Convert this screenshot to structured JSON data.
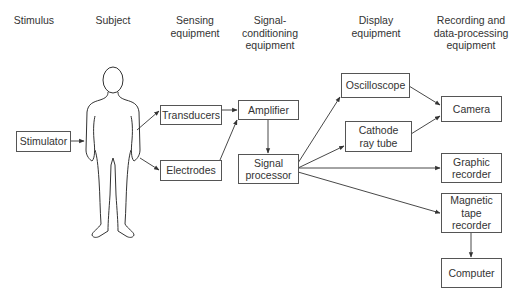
{
  "headers": {
    "stimulus": "Stimulus",
    "subject": "Subject",
    "sensing": "Sensing\nequipment",
    "conditioning": "Signal-\nconditioning\nequipment",
    "display": "Display\nequipment",
    "recording": "Recording and\ndata-processing\nequipment"
  },
  "nodes": {
    "stimulator": "Stimulator",
    "transducers": "Transducers",
    "electrodes": "Electrodes",
    "amplifier": "Amplifier",
    "signal_processor": "Signal\nprocessor",
    "oscilloscope": "Oscilloscope",
    "crt": "Cathode\nray tube",
    "camera": "Camera",
    "graphic_recorder": "Graphic\nrecorder",
    "tape_recorder": "Magnetic\ntape\nrecorder",
    "computer": "Computer"
  },
  "subject_figure": "human-body-outline",
  "edges": [
    [
      "Stimulator",
      "Subject"
    ],
    [
      "Subject",
      "Transducers"
    ],
    [
      "Subject",
      "Electrodes"
    ],
    [
      "Transducers",
      "Amplifier"
    ],
    [
      "Electrodes",
      "Amplifier"
    ],
    [
      "Amplifier",
      "Signal processor"
    ],
    [
      "Signal processor",
      "Oscilloscope"
    ],
    [
      "Signal processor",
      "Cathode ray tube"
    ],
    [
      "Signal processor",
      "Graphic recorder"
    ],
    [
      "Signal processor",
      "Magnetic tape recorder"
    ],
    [
      "Oscilloscope",
      "Camera"
    ],
    [
      "Cathode ray tube",
      "Camera"
    ],
    [
      "Magnetic tape recorder",
      "Computer"
    ]
  ],
  "colors": {
    "line": "#333333",
    "box_border": "#555555",
    "text": "#333333"
  }
}
